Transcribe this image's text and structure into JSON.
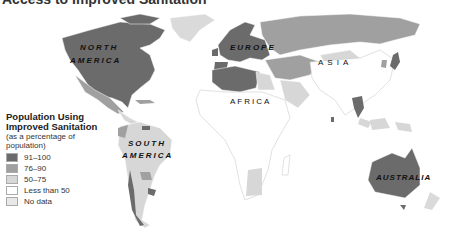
{
  "title": "Access to Improved Sanitation",
  "legend": {
    "title_line1": "Population Using",
    "title_line2": "Improved Sanitation",
    "subtitle_line1": "(as a percentage of",
    "subtitle_line2": "population)",
    "items": [
      {
        "label": "91–100",
        "color": "#6b6b6b"
      },
      {
        "label": "76–90",
        "color": "#a0a0a0"
      },
      {
        "label": "50–75",
        "color": "#d7d7d7"
      },
      {
        "label": "Less than 50",
        "color": "#ffffff"
      },
      {
        "label": "No data",
        "color": "#e8e8e8"
      }
    ]
  },
  "labels": {
    "north_america_1": "NORTH",
    "north_america_2": "AMERICA",
    "south_america_1": "SOUTH",
    "south_america_2": "AMERICA",
    "europe": "EUROPE",
    "asia": "ASIA",
    "africa": "AFRICA",
    "australia": "AUSTRALIA"
  }
}
